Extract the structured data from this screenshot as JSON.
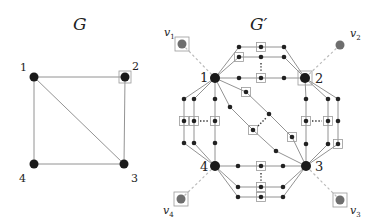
{
  "figure": {
    "left": {
      "title": "G",
      "nodes": [
        {
          "id": "1",
          "label": "1",
          "x": 34,
          "y": 77,
          "lx": 20,
          "ly": 71,
          "boxed": false
        },
        {
          "id": "2",
          "label": "2",
          "x": 125,
          "y": 77,
          "lx": 132,
          "ly": 70,
          "boxed": true
        },
        {
          "id": "3",
          "label": "3",
          "x": 124,
          "y": 164,
          "lx": 131,
          "ly": 182,
          "boxed": false
        },
        {
          "id": "4",
          "label": "4",
          "x": 34,
          "y": 164,
          "lx": 19,
          "ly": 182,
          "boxed": false
        }
      ],
      "edges": [
        [
          "1",
          "2"
        ],
        [
          "2",
          "3"
        ],
        [
          "3",
          "4"
        ],
        [
          "4",
          "1"
        ],
        [
          "1",
          "3"
        ]
      ]
    },
    "right": {
      "title": "G′",
      "main_nodes": [
        {
          "id": "1",
          "label": "1",
          "x": 215,
          "y": 78,
          "lx": 200,
          "ly": 82,
          "boxed": false
        },
        {
          "id": "2",
          "label": "2",
          "x": 305,
          "y": 78,
          "lx": 315,
          "ly": 83,
          "boxed": true
        },
        {
          "id": "3",
          "label": "3",
          "x": 306,
          "y": 166,
          "lx": 315,
          "ly": 171,
          "boxed": false
        },
        {
          "id": "4",
          "label": "4",
          "x": 215,
          "y": 166,
          "lx": 200,
          "ly": 171,
          "boxed": false
        }
      ],
      "terminals": [
        {
          "id": "v1",
          "label": "v",
          "sub": "1",
          "x": 182,
          "y": 44,
          "lx": 164,
          "ly": 36,
          "boxed": true,
          "attach": "1"
        },
        {
          "id": "v2",
          "label": "v",
          "sub": "2",
          "x": 340,
          "y": 45,
          "lx": 350,
          "ly": 37,
          "boxed": false,
          "attach": "2"
        },
        {
          "id": "v3",
          "label": "v",
          "sub": "3",
          "x": 340,
          "y": 200,
          "lx": 350,
          "ly": 214,
          "boxed": true,
          "attach": "3"
        },
        {
          "id": "v4",
          "label": "v",
          "sub": "4",
          "x": 181,
          "y": 199,
          "lx": 163,
          "ly": 214,
          "boxed": true,
          "attach": "4"
        }
      ],
      "gadget_nodes": [
        {
          "id": "t1a",
          "x": 239,
          "y": 47,
          "boxed": false
        },
        {
          "id": "t1b",
          "x": 261,
          "y": 47,
          "boxed": true
        },
        {
          "id": "t1c",
          "x": 284,
          "y": 47,
          "boxed": false
        },
        {
          "id": "t2a",
          "x": 239,
          "y": 57,
          "boxed": true
        },
        {
          "id": "t2b",
          "x": 261,
          "y": 57,
          "boxed": false
        },
        {
          "id": "t2c",
          "x": 284,
          "y": 57,
          "boxed": false
        },
        {
          "id": "t3a",
          "x": 239,
          "y": 78,
          "boxed": false
        },
        {
          "id": "t3b",
          "x": 261,
          "y": 78,
          "boxed": true
        },
        {
          "id": "t3c",
          "x": 284,
          "y": 78,
          "boxed": false
        },
        {
          "id": "l1a",
          "x": 184,
          "y": 99,
          "boxed": false
        },
        {
          "id": "l1b",
          "x": 184,
          "y": 121,
          "boxed": true
        },
        {
          "id": "l1c",
          "x": 184,
          "y": 143,
          "boxed": false
        },
        {
          "id": "l2a",
          "x": 194,
          "y": 99,
          "boxed": false
        },
        {
          "id": "l2b",
          "x": 194,
          "y": 121,
          "boxed": true
        },
        {
          "id": "l2c",
          "x": 194,
          "y": 143,
          "boxed": false
        },
        {
          "id": "l3a",
          "x": 215,
          "y": 99,
          "boxed": false
        },
        {
          "id": "l3b",
          "x": 215,
          "y": 121,
          "boxed": true
        },
        {
          "id": "l3c",
          "x": 215,
          "y": 143,
          "boxed": false
        },
        {
          "id": "r1a",
          "x": 306,
          "y": 99,
          "boxed": false
        },
        {
          "id": "r1b",
          "x": 306,
          "y": 121,
          "boxed": true
        },
        {
          "id": "r1c",
          "x": 306,
          "y": 144,
          "boxed": false
        },
        {
          "id": "r2a",
          "x": 328,
          "y": 99,
          "boxed": false
        },
        {
          "id": "r2b",
          "x": 328,
          "y": 121,
          "boxed": true
        },
        {
          "id": "r2c",
          "x": 328,
          "y": 144,
          "boxed": false
        },
        {
          "id": "r3a",
          "x": 338,
          "y": 99,
          "boxed": false
        },
        {
          "id": "r3b",
          "x": 338,
          "y": 121,
          "boxed": false
        },
        {
          "id": "r3c",
          "x": 338,
          "y": 144,
          "boxed": true
        },
        {
          "id": "d1a",
          "x": 246,
          "y": 92,
          "boxed": true
        },
        {
          "id": "d1b",
          "x": 269,
          "y": 114,
          "boxed": false
        },
        {
          "id": "d1c",
          "x": 292,
          "y": 137,
          "boxed": true
        },
        {
          "id": "d2a",
          "x": 230,
          "y": 107,
          "boxed": false
        },
        {
          "id": "d2b",
          "x": 253,
          "y": 130,
          "boxed": true
        },
        {
          "id": "d2c",
          "x": 276,
          "y": 151,
          "boxed": false
        },
        {
          "id": "b1a",
          "x": 238,
          "y": 166,
          "boxed": false
        },
        {
          "id": "b1b",
          "x": 261,
          "y": 166,
          "boxed": true
        },
        {
          "id": "b1c",
          "x": 283,
          "y": 166,
          "boxed": false
        },
        {
          "id": "b2a",
          "x": 238,
          "y": 187,
          "boxed": false
        },
        {
          "id": "b2b",
          "x": 261,
          "y": 187,
          "boxed": true
        },
        {
          "id": "b2c",
          "x": 283,
          "y": 187,
          "boxed": false
        },
        {
          "id": "b3a",
          "x": 238,
          "y": 197,
          "boxed": false
        },
        {
          "id": "b3b",
          "x": 261,
          "y": 197,
          "boxed": true
        },
        {
          "id": "b3c",
          "x": 283,
          "y": 197,
          "boxed": false
        }
      ],
      "edges": [
        [
          "1",
          "t1a"
        ],
        [
          "t1a",
          "t1b"
        ],
        [
          "t1b",
          "t1c"
        ],
        [
          "t1c",
          "2"
        ],
        [
          "1",
          "t2a"
        ],
        [
          "t2a",
          "t2b"
        ],
        [
          "t2b",
          "t2c"
        ],
        [
          "t2c",
          "2"
        ],
        [
          "1",
          "t3a"
        ],
        [
          "t3a",
          "t3b"
        ],
        [
          "t3b",
          "t3c"
        ],
        [
          "t3c",
          "2"
        ],
        [
          "1",
          "l1a"
        ],
        [
          "l1a",
          "l1b"
        ],
        [
          "l1b",
          "l1c"
        ],
        [
          "l1c",
          "4"
        ],
        [
          "1",
          "l2a"
        ],
        [
          "l2a",
          "l2b"
        ],
        [
          "l2b",
          "l2c"
        ],
        [
          "l2c",
          "4"
        ],
        [
          "1",
          "l3a"
        ],
        [
          "l3a",
          "l3b"
        ],
        [
          "l3b",
          "l3c"
        ],
        [
          "l3c",
          "4"
        ],
        [
          "2",
          "r1a"
        ],
        [
          "r1a",
          "r1b"
        ],
        [
          "r1b",
          "r1c"
        ],
        [
          "r1c",
          "3"
        ],
        [
          "2",
          "r2a"
        ],
        [
          "r2a",
          "r2b"
        ],
        [
          "r2b",
          "r2c"
        ],
        [
          "r2c",
          "3"
        ],
        [
          "2",
          "r3a"
        ],
        [
          "r3a",
          "r3b"
        ],
        [
          "r3b",
          "r3c"
        ],
        [
          "r3c",
          "3"
        ],
        [
          "1",
          "d1a"
        ],
        [
          "d1a",
          "d1b"
        ],
        [
          "d1b",
          "d1c"
        ],
        [
          "d1c",
          "3"
        ],
        [
          "1",
          "d2a"
        ],
        [
          "d2a",
          "d2b"
        ],
        [
          "d2b",
          "d2c"
        ],
        [
          "d2c",
          "3"
        ],
        [
          "4",
          "b1a"
        ],
        [
          "b1a",
          "b1b"
        ],
        [
          "b1b",
          "b1c"
        ],
        [
          "b1c",
          "3"
        ],
        [
          "4",
          "b2a"
        ],
        [
          "b2a",
          "b2b"
        ],
        [
          "b2b",
          "b2c"
        ],
        [
          "b2c",
          "3"
        ],
        [
          "4",
          "b3a"
        ],
        [
          "b3a",
          "b3b"
        ],
        [
          "b3b",
          "b3c"
        ],
        [
          "b3c",
          "3"
        ]
      ],
      "ellipses": [
        {
          "orient": "v",
          "x": 261,
          "y1": 63,
          "y2": 72
        },
        {
          "orient": "h",
          "y": 121,
          "x1": 200,
          "x2": 209
        },
        {
          "orient": "h",
          "y": 121,
          "x1": 312,
          "x2": 322
        },
        {
          "orient": "d",
          "x1": 258,
          "y1": 126,
          "x2": 266,
          "y2": 118
        },
        {
          "orient": "v",
          "x": 261,
          "y1": 173,
          "y2": 182
        }
      ]
    }
  },
  "colors": {
    "main_node": "#1a1a1a",
    "gadget_node": "#222222",
    "terminal_node": "#6e6e6e",
    "edge": "#777777",
    "dashed_link": "#bbbbbb",
    "box": "#999999"
  }
}
